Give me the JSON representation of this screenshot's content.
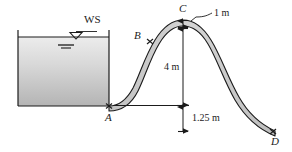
{
  "figure": {
    "background_color": "#ffffff",
    "line_color": "#1b1b1b",
    "water_fill_top_color": "#e9e9e9",
    "water_fill_bottom_color": "#b9b9b9",
    "spillway_fill_color": "#c9c9c9"
  },
  "labels": {
    "water_surface": "WS",
    "point_a": "A",
    "point_b": "B",
    "point_c": "C",
    "point_d": "D"
  },
  "dimensions": {
    "crest_thickness": "1 m",
    "crest_height": "4 m",
    "tailwater_drop": "1.25 m"
  },
  "icons": {
    "water_surface_symbol": "water-surface-triangle-icon",
    "point_marker": "x-marker-icon",
    "leader_line": "leader-line-icon",
    "dimension_arrow": "dimension-arrow-icon"
  }
}
